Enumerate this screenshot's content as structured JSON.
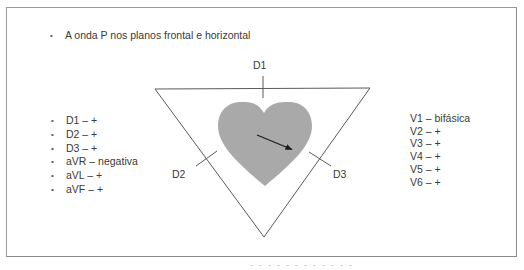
{
  "slide": {
    "title": "A onda P nos planos frontal e horizontal",
    "bullet_glyph": "•",
    "frontal_plane_leads": [
      {
        "label": "D1 – +"
      },
      {
        "label": "D2 – +"
      },
      {
        "label": "D3 – +"
      },
      {
        "label": "aVR – negativa"
      },
      {
        "label": "aVL – +"
      },
      {
        "label": "aVF – +"
      }
    ],
    "horizontal_plane_leads": [
      {
        "label": "V1 – bifásica"
      },
      {
        "label": "V2 – +"
      },
      {
        "label": "V3 – +"
      },
      {
        "label": "V4 – +"
      },
      {
        "label": "V5 – +"
      },
      {
        "label": "V6 – +"
      }
    ]
  },
  "diagram": {
    "type": "einthoven-triangle",
    "lead_labels": {
      "d1": "D1",
      "d2": "D2",
      "d3": "D3"
    },
    "colors": {
      "triangle_stroke": "#5a5a5a",
      "heart_fill": "#a9a9a9",
      "arrow": "#1a1a1a",
      "frame_border": "#9a9a9a",
      "text": "#3a3a3a"
    },
    "vector": {
      "description": "P-wave electrical axis arrow pointing down-right",
      "from": [
        257,
        135
      ],
      "to": [
        293,
        150
      ]
    }
  }
}
